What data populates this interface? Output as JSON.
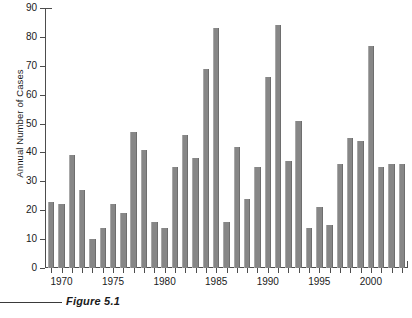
{
  "figure": {
    "caption_label": "Figure 5.1",
    "caption_continuation": "",
    "rule": "caption-rule"
  },
  "axes": {
    "y_title": "Annual Number of Cases",
    "y_ticks": [
      "0",
      "10",
      "20",
      "30",
      "40",
      "50",
      "60",
      "70",
      "80",
      "90"
    ],
    "x_ticks": [
      "1970",
      "1975",
      "1980",
      "1985",
      "1990",
      "1995",
      "2000"
    ]
  },
  "colors": {
    "bar_fill": "#878787",
    "bar_edge_light": "#a8a8a8",
    "bar_edge_dark": "#6e6e6e",
    "axis": "#4d4d4d",
    "text": "#1a1a1a",
    "background": "#ffffff"
  },
  "chart_data": {
    "type": "bar",
    "title": "Figure 5.1",
    "xlabel": "",
    "ylabel": "Annual Number of Cases",
    "ylim": [
      0,
      90
    ],
    "xlim": [
      1968.4,
      2003.6
    ],
    "ytick_values": [
      0,
      10,
      20,
      30,
      40,
      50,
      60,
      70,
      80,
      90
    ],
    "xtick_values": [
      1970,
      1975,
      1980,
      1985,
      1990,
      1995,
      2000
    ],
    "grid": false,
    "legend": null,
    "categories": [
      1969,
      1970,
      1971,
      1972,
      1973,
      1974,
      1975,
      1976,
      1977,
      1978,
      1979,
      1980,
      1981,
      1982,
      1983,
      1984,
      1985,
      1986,
      1987,
      1988,
      1989,
      1990,
      1991,
      1992,
      1993,
      1994,
      1995,
      1996,
      1997,
      1998,
      1999,
      2000,
      2001,
      2002,
      2003
    ],
    "values": [
      23,
      22,
      39,
      27,
      10,
      14,
      22,
      19,
      47,
      41,
      16,
      14,
      35,
      46,
      38,
      69,
      83,
      16,
      42,
      24,
      35,
      66,
      84,
      37,
      51,
      14,
      21,
      15,
      36,
      45,
      44,
      77,
      35,
      36,
      36
    ],
    "series": [
      {
        "name": "Annual Number of Cases",
        "values": [
          23,
          22,
          39,
          27,
          10,
          14,
          22,
          19,
          47,
          41,
          16,
          14,
          35,
          46,
          38,
          69,
          83,
          16,
          42,
          24,
          35,
          66,
          84,
          37,
          51,
          14,
          21,
          15,
          36,
          45,
          44,
          77,
          35,
          36,
          36
        ]
      }
    ]
  }
}
